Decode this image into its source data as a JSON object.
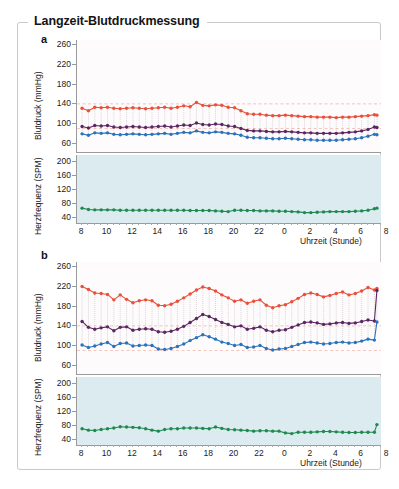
{
  "figure": {
    "title": "Langzeit-Blutdruckmessung",
    "panels": [
      "a",
      "b"
    ]
  },
  "legend": {
    "items": [
      {
        "label": "systolisch",
        "color": "#e8503a"
      },
      {
        "label": "MAD (mittlerer arterieller Druck)",
        "color": "#5c2663"
      },
      {
        "label": "diastolisch",
        "color": "#2a72bd"
      },
      {
        "label": "Herzfrequenz",
        "color": "#1e8a4e"
      }
    ]
  },
  "axes": {
    "bp_ylabel": "Blutdruck (mmHg)",
    "bp_yticks": [
      60,
      100,
      140,
      180,
      220,
      260
    ],
    "hr_ylabel": "Herzfrequenz (SPM)",
    "hr_yticks": [
      40,
      80,
      120,
      160,
      200
    ],
    "xlabel": "Uhrzeit (Stunde)",
    "xticks": [
      8,
      10,
      12,
      14,
      16,
      18,
      20,
      22,
      0,
      2,
      4,
      6,
      8
    ]
  },
  "chart_data": [
    {
      "type": "line",
      "panel": "a",
      "title": "Langzeit-Blutdruckmessung",
      "xlabel": "Uhrzeit (Stunde)",
      "ylabel": "Blutdruck (mmHg)",
      "ylim": [
        40,
        270
      ],
      "xlim": [
        7.4,
        8.2
      ],
      "grid": false,
      "legend_position": "top-right",
      "reference_lines": [
        {
          "value": 140,
          "color": "#e8503a",
          "style": "dashed"
        },
        {
          "value": 90,
          "color": "#e8503a",
          "style": "dashed"
        }
      ],
      "x": [
        8,
        8.5,
        9,
        9.5,
        10,
        10.5,
        11,
        11.5,
        12,
        12.5,
        13,
        13.5,
        14,
        14.5,
        15,
        15.5,
        16,
        16.5,
        17,
        17.5,
        18,
        18.5,
        19,
        19.5,
        20,
        20.5,
        21,
        21.5,
        22,
        22.5,
        23,
        23.5,
        0,
        0.5,
        1,
        1.5,
        2,
        2.5,
        3,
        3.5,
        4,
        4.5,
        5,
        5.5,
        6,
        6.5,
        7,
        7.2
      ],
      "x_hours": [
        8,
        8.5,
        9,
        9.5,
        10,
        10.5,
        11,
        11.5,
        12,
        12.5,
        13,
        13.5,
        14,
        14.5,
        15,
        15.5,
        16,
        16.5,
        17,
        17.5,
        18,
        18.5,
        19,
        19.5,
        20,
        20.5,
        21,
        21.5,
        22,
        22.5,
        23,
        23.5,
        24,
        24.5,
        25,
        25.5,
        26,
        26.5,
        27,
        27.5,
        28,
        28.5,
        29,
        29.5,
        30,
        30.5,
        31,
        31.2
      ],
      "series": [
        {
          "name": "systolisch",
          "color": "#e8503a",
          "values": [
            131,
            126,
            133,
            132,
            133,
            131,
            130,
            131,
            132,
            131,
            130,
            131,
            132,
            133,
            131,
            133,
            136,
            134,
            143,
            137,
            136,
            138,
            137,
            133,
            132,
            126,
            120,
            119,
            119,
            117,
            116,
            116,
            117,
            116,
            115,
            114,
            114,
            113,
            113,
            113,
            112,
            113,
            113,
            114,
            115,
            116,
            118,
            117
          ]
        },
        {
          "name": "MAD (mittlerer arterieller Druck)",
          "color": "#5c2663",
          "values": [
            94,
            91,
            96,
            95,
            96,
            93,
            92,
            93,
            94,
            93,
            92,
            93,
            94,
            95,
            93,
            95,
            97,
            96,
            101,
            98,
            97,
            99,
            98,
            95,
            94,
            90,
            86,
            85,
            85,
            84,
            83,
            83,
            84,
            83,
            82,
            81,
            81,
            80,
            80,
            80,
            80,
            81,
            82,
            83,
            85,
            88,
            93,
            92
          ]
        },
        {
          "name": "diastolisch",
          "color": "#2a72bd",
          "values": [
            79,
            76,
            81,
            80,
            81,
            78,
            77,
            78,
            79,
            78,
            77,
            78,
            79,
            80,
            78,
            80,
            82,
            81,
            85,
            82,
            81,
            83,
            82,
            80,
            79,
            76,
            72,
            71,
            71,
            70,
            69,
            69,
            70,
            69,
            68,
            67,
            67,
            66,
            66,
            66,
            66,
            67,
            68,
            69,
            71,
            74,
            78,
            77
          ]
        },
        {
          "name": "Herzfrequenz",
          "color": "#1e8a4e",
          "values": [
            66,
            62,
            61,
            61,
            61,
            61,
            60,
            60,
            60,
            60,
            60,
            60,
            60,
            60,
            60,
            60,
            60,
            59,
            59,
            59,
            59,
            58,
            57,
            56,
            60,
            60,
            59,
            59,
            58,
            58,
            58,
            57,
            57,
            56,
            55,
            53,
            53,
            54,
            55,
            56,
            56,
            56,
            56,
            57,
            58,
            60,
            64,
            66
          ]
        }
      ]
    },
    {
      "type": "line",
      "panel": "b",
      "xlabel": "Uhrzeit (Stunde)",
      "ylabel": "Blutdruck (mmHg)",
      "ylim": [
        40,
        270
      ],
      "grid": false,
      "reference_lines": [
        {
          "value": 140,
          "color": "#e8503a",
          "style": "dashed"
        },
        {
          "value": 90,
          "color": "#e8503a",
          "style": "dashed"
        }
      ],
      "x_hours": [
        8,
        8.5,
        9,
        9.5,
        10,
        10.5,
        11,
        11.5,
        12,
        12.5,
        13,
        13.5,
        14,
        14.5,
        15,
        15.5,
        16,
        16.5,
        17,
        17.5,
        18,
        18.5,
        19,
        19.5,
        20,
        20.5,
        21,
        21.5,
        22,
        22.5,
        23,
        23.5,
        24,
        24.5,
        25,
        25.5,
        26,
        26.5,
        27,
        27.5,
        28,
        28.5,
        29,
        29.5,
        30,
        30.5,
        31,
        31.2
      ],
      "series": [
        {
          "name": "systolisch",
          "color": "#e8503a",
          "values": [
            220,
            214,
            207,
            206,
            204,
            193,
            203,
            194,
            187,
            191,
            193,
            191,
            182,
            181,
            184,
            190,
            197,
            205,
            213,
            219,
            216,
            211,
            203,
            197,
            190,
            193,
            186,
            190,
            193,
            182,
            177,
            181,
            183,
            189,
            196,
            204,
            207,
            204,
            199,
            202,
            206,
            209,
            203,
            206,
            211,
            218,
            213,
            216
          ]
        },
        {
          "name": "MAD (mittlerer arterieller Druck)",
          "color": "#5c2663",
          "values": [
            149,
            137,
            133,
            136,
            138,
            130,
            137,
            138,
            131,
            133,
            134,
            133,
            128,
            127,
            129,
            133,
            139,
            147,
            155,
            163,
            159,
            153,
            147,
            143,
            138,
            140,
            133,
            135,
            138,
            131,
            128,
            131,
            132,
            137,
            142,
            147,
            148,
            146,
            143,
            144,
            146,
            147,
            145,
            146,
            149,
            152,
            150,
            212
          ]
        },
        {
          "name": "diastolisch",
          "color": "#2a72bd",
          "values": [
            101,
            96,
            99,
            103,
            106,
            98,
            104,
            105,
            99,
            100,
            101,
            100,
            93,
            92,
            94,
            98,
            103,
            110,
            116,
            122,
            118,
            113,
            107,
            104,
            100,
            102,
            96,
            97,
            100,
            94,
            91,
            93,
            94,
            98,
            102,
            106,
            107,
            105,
            103,
            104,
            106,
            107,
            105,
            106,
            109,
            113,
            111,
            148
          ]
        },
        {
          "name": "Herzfrequenz",
          "color": "#1e8a4e",
          "values": [
            70,
            66,
            65,
            68,
            70,
            72,
            76,
            75,
            74,
            73,
            70,
            66,
            63,
            68,
            70,
            70,
            72,
            72,
            72,
            71,
            70,
            75,
            71,
            68,
            67,
            66,
            65,
            63,
            64,
            64,
            63,
            63,
            58,
            56,
            60,
            60,
            60,
            61,
            62,
            62,
            61,
            60,
            59,
            59,
            60,
            60,
            60,
            82
          ]
        }
      ]
    }
  ]
}
